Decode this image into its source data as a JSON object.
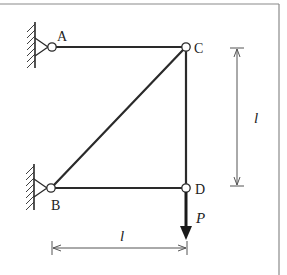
{
  "diagram": {
    "type": "truss",
    "nodes": [
      {
        "id": "A",
        "label": "A",
        "x": 52,
        "y": 47,
        "support": "pin-wall-left"
      },
      {
        "id": "B",
        "label": "B",
        "x": 51,
        "y": 188,
        "support": "pin-wall-left"
      },
      {
        "id": "C",
        "label": "C",
        "x": 186,
        "y": 47,
        "support": "none"
      },
      {
        "id": "D",
        "label": "D",
        "x": 186,
        "y": 188,
        "support": "none"
      }
    ],
    "members": [
      {
        "from": "A",
        "to": "C"
      },
      {
        "from": "B",
        "to": "C"
      },
      {
        "from": "B",
        "to": "D"
      },
      {
        "from": "C",
        "to": "D"
      }
    ],
    "load": {
      "node": "D",
      "label": "P",
      "direction": "down"
    },
    "dimensions": {
      "horizontal": {
        "label": "l",
        "from": "B",
        "to": "D"
      },
      "vertical": {
        "label": "l",
        "from": "C",
        "to": "D"
      }
    }
  }
}
